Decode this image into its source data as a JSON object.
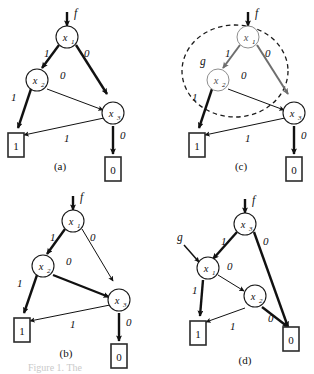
{
  "figure": {
    "background_color": "#ffffff",
    "ink_color": "#111111",
    "faded_color": "#8e8e8e",
    "partial_caption": "Figure 1. The"
  },
  "common": {
    "node_prefix": "x",
    "terminal_one": "1",
    "terminal_zero": "0",
    "edge_label_one": "1",
    "edge_label_zero": "0",
    "root_function": "f",
    "subfunction": "g"
  },
  "panels": [
    {
      "id": "a",
      "caption": "(a)",
      "root_label": "f",
      "nodes": [
        {
          "name": "x",
          "sub": "1"
        },
        {
          "name": "x",
          "sub": "2"
        },
        {
          "name": "x",
          "sub": "3"
        }
      ],
      "terminals": [
        "1",
        "0"
      ],
      "edges": [
        {
          "from": "x1",
          "to": "x2",
          "label": "1",
          "weight": "thick"
        },
        {
          "from": "x1",
          "to": "x3",
          "label": "0",
          "weight": "thick"
        },
        {
          "from": "x2",
          "to": "x3",
          "label": "0",
          "weight": "thin"
        },
        {
          "from": "x2",
          "to": "T1",
          "label": "1",
          "weight": "thick"
        },
        {
          "from": "x3",
          "to": "T1",
          "label": "1",
          "weight": "thin"
        },
        {
          "from": "x3",
          "to": "T0",
          "label": "0",
          "weight": "thick"
        }
      ],
      "annotation": null
    },
    {
      "id": "b",
      "caption": "(b)",
      "root_label": "f",
      "nodes": [
        {
          "name": "x",
          "sub": "1"
        },
        {
          "name": "x",
          "sub": "2"
        },
        {
          "name": "x",
          "sub": "3"
        }
      ],
      "terminals": [
        "1",
        "0"
      ],
      "edges": [
        {
          "from": "x1",
          "to": "x2",
          "label": "1",
          "weight": "thick"
        },
        {
          "from": "x1",
          "to": "x3",
          "label": "0",
          "weight": "thin"
        },
        {
          "from": "x2",
          "to": "x3",
          "label": "0",
          "weight": "thick"
        },
        {
          "from": "x2",
          "to": "T1",
          "label": "1",
          "weight": "thick"
        },
        {
          "from": "x3",
          "to": "T1",
          "label": "1",
          "weight": "thin"
        },
        {
          "from": "x3",
          "to": "T0",
          "label": "0",
          "weight": "thick"
        }
      ],
      "annotation": null
    },
    {
      "id": "c",
      "caption": "(c)",
      "root_label": "f",
      "nodes": [
        {
          "name": "x",
          "sub": "1"
        },
        {
          "name": "x",
          "sub": "2"
        },
        {
          "name": "x",
          "sub": "3"
        }
      ],
      "terminals": [
        "1",
        "0"
      ],
      "edges": [
        {
          "from": "x1",
          "to": "x2",
          "label": "1",
          "weight": "thick"
        },
        {
          "from": "x1",
          "to": "x3",
          "label": "0",
          "weight": "thick"
        },
        {
          "from": "x2",
          "to": "x3",
          "label": "0",
          "weight": "thin"
        },
        {
          "from": "x2",
          "to": "T1",
          "label": "1",
          "weight": "thick"
        },
        {
          "from": "x3",
          "to": "T1",
          "label": "1",
          "weight": "thin"
        },
        {
          "from": "x3",
          "to": "T0",
          "label": "0",
          "weight": "thick"
        }
      ],
      "annotation": {
        "kind": "dashed-ellipse",
        "label": "g",
        "encircles": [
          "x1",
          "x2"
        ]
      }
    },
    {
      "id": "d",
      "caption": "(d)",
      "root_label": "f",
      "nodes": [
        {
          "name": "x",
          "sub": "3"
        },
        {
          "name": "x",
          "sub": "1"
        },
        {
          "name": "x",
          "sub": "2"
        }
      ],
      "terminals": [
        "1",
        "0"
      ],
      "edges": [
        {
          "from": "x3",
          "to": "x1",
          "label": "1",
          "weight": "thick"
        },
        {
          "from": "x3",
          "to": "T0",
          "label": "0",
          "weight": "thick"
        },
        {
          "from": "x1",
          "to": "x2",
          "label": "0",
          "weight": "thin"
        },
        {
          "from": "x1",
          "to": "T1",
          "label": "1",
          "weight": "thick"
        },
        {
          "from": "x2",
          "to": "T1",
          "label": "1",
          "weight": "thin"
        },
        {
          "from": "x2",
          "to": "T0",
          "label": "0",
          "weight": "thick"
        }
      ],
      "annotation": {
        "kind": "incoming-arrow",
        "label": "g",
        "target": "x1"
      }
    }
  ]
}
